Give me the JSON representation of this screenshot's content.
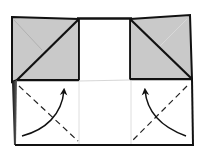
{
  "diagram": {
    "title": "",
    "type": "origami-fold-step",
    "colors": {
      "background": "#ffffff",
      "paper_back": "#c8c8c8",
      "paper_front": "#ffffff",
      "outline": "#111111",
      "crease_light": "#d8d8d8",
      "crease_faint": "#a9a9a9",
      "fold_line": "#222222"
    },
    "elements": {
      "left_flap": "Gray folded triangle flap, upper left",
      "right_flap": "Gray folded triangle flap, upper right",
      "center_opening": "White center rectangle",
      "bottom_panel": "White lower panel",
      "left_valley_fold": "Dashed valley-fold line, lower left",
      "right_valley_fold": "Dashed valley-fold line, lower right",
      "left_arrow": "Curved arrow folding lower-left corner up",
      "right_arrow": "Curved arrow folding lower-right corner up"
    }
  }
}
